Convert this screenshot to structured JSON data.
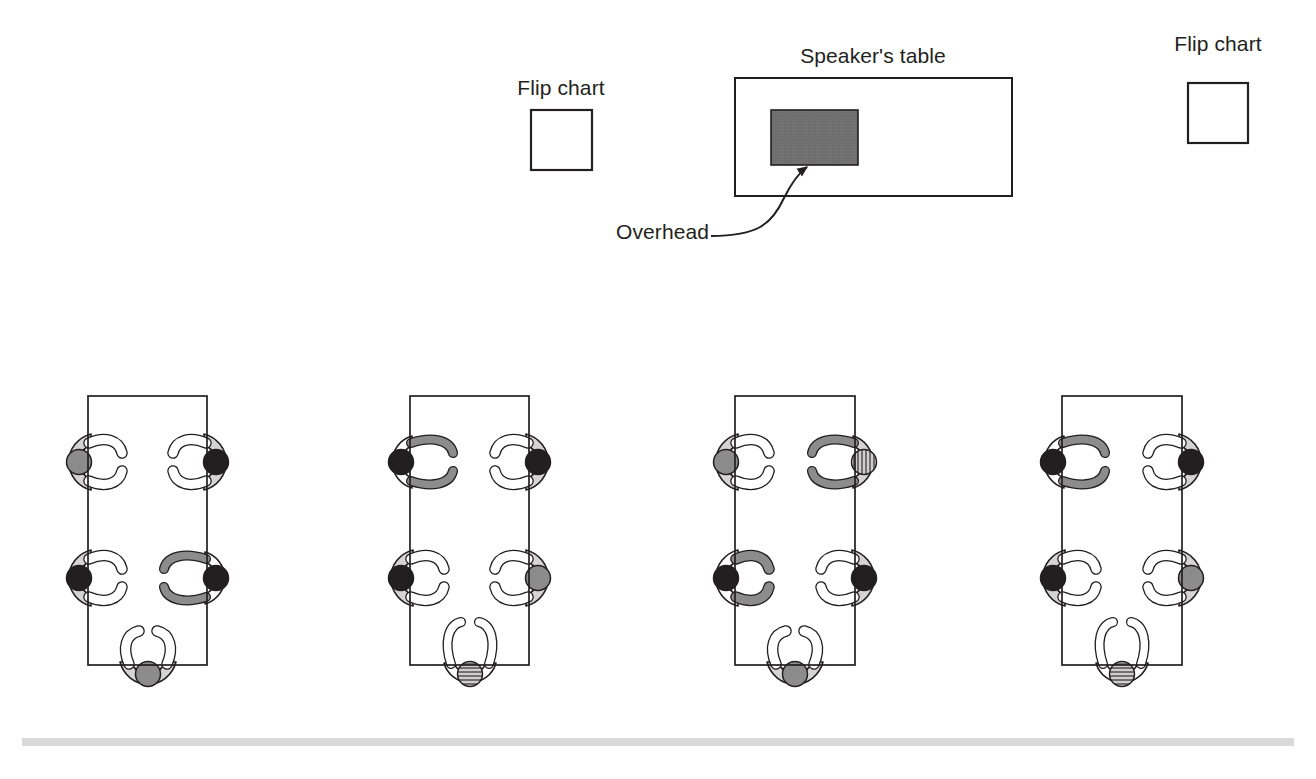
{
  "diagram": {
    "title_visible": false,
    "background_color": "#ffffff",
    "stroke_color": "#231f20",
    "room": {
      "front": {
        "flip_chart_left": {
          "label": "Flip chart",
          "label_x": 561,
          "label_y": 88,
          "x": 531,
          "y": 110,
          "w": 61,
          "h": 60,
          "fill": "#ffffff"
        },
        "flip_chart_right": {
          "label": "Flip chart",
          "label_x": 1218,
          "label_y": 61,
          "x": 1188,
          "y": 83,
          "w": 60,
          "h": 60,
          "fill": "#ffffff"
        },
        "speakers_table": {
          "label": "Speaker's table",
          "label_x": 873,
          "label_y": 56,
          "x": 735,
          "y": 78,
          "w": 277,
          "h": 118,
          "fill": "#ffffff"
        },
        "overhead": {
          "label": "Overhead",
          "label_x": 616,
          "label_y": 235,
          "x": 771,
          "y": 110,
          "w": 87,
          "h": 55,
          "fill": "#6e6e6e"
        }
      },
      "footer_rule": {
        "x": 22,
        "y": 738,
        "w": 1272,
        "h": 8,
        "color": "#d9d9d9"
      }
    },
    "palette": {
      "head_gray": "#8c8c8c",
      "head_black": "#231f20",
      "head_hatched": "#b3b3b3",
      "body_light": "#d4d4d4",
      "body_white": "#ffffff",
      "arm_white": "#ffffff",
      "arm_gray": "#8c8c8c",
      "outline": "#231f20",
      "overhead_gray": "#6e6e6e"
    },
    "tables": [
      {
        "name": "table-1",
        "x": 88,
        "y": 396,
        "w": 119,
        "h": 269,
        "seats": [
          {
            "position": "left-top",
            "cx": 88,
            "cy": 462,
            "facing": "right",
            "head": "gray",
            "body": "light",
            "arms": "white",
            "pose": "open"
          },
          {
            "position": "right-top",
            "cx": 207,
            "cy": 462,
            "facing": "left",
            "head": "black",
            "body": "light",
            "arms": "white",
            "pose": "open"
          },
          {
            "position": "left-bottom",
            "cx": 88,
            "cy": 578,
            "facing": "right",
            "head": "black",
            "body": "light",
            "arms": "white",
            "pose": "open"
          },
          {
            "position": "right-bottom",
            "cx": 207,
            "cy": 578,
            "facing": "left",
            "head": "black",
            "body": "white",
            "arms": "gray",
            "pose": "wide"
          },
          {
            "position": "bottom-head",
            "cx": 148,
            "cy": 665,
            "facing": "up",
            "head": "gray",
            "body": "light",
            "arms": "white",
            "pose": "open"
          }
        ]
      },
      {
        "name": "table-2",
        "x": 410,
        "y": 396,
        "w": 119,
        "h": 269,
        "seats": [
          {
            "position": "left-top",
            "cx": 410,
            "cy": 462,
            "facing": "right",
            "head": "black",
            "body": "white",
            "arms": "gray",
            "pose": "wide"
          },
          {
            "position": "right-top",
            "cx": 529,
            "cy": 462,
            "facing": "left",
            "head": "black",
            "body": "light",
            "arms": "white",
            "pose": "open"
          },
          {
            "position": "left-bottom",
            "cx": 410,
            "cy": 578,
            "facing": "right",
            "head": "black",
            "body": "light",
            "arms": "white",
            "pose": "open"
          },
          {
            "position": "right-bottom",
            "cx": 529,
            "cy": 578,
            "facing": "left",
            "head": "gray",
            "body": "light",
            "arms": "white",
            "pose": "open"
          },
          {
            "position": "bottom-head",
            "cx": 470,
            "cy": 665,
            "facing": "up",
            "head": "hatched",
            "body": "white",
            "arms": "white",
            "pose": "wide"
          }
        ]
      },
      {
        "name": "table-3",
        "x": 735,
        "y": 396,
        "w": 120,
        "h": 269,
        "seats": [
          {
            "position": "left-top",
            "cx": 735,
            "cy": 462,
            "facing": "right",
            "head": "gray",
            "body": "light",
            "arms": "white",
            "pose": "open"
          },
          {
            "position": "right-top",
            "cx": 855,
            "cy": 462,
            "facing": "left",
            "head": "hatched",
            "body": "light",
            "arms": "gray",
            "pose": "wide"
          },
          {
            "position": "left-bottom",
            "cx": 735,
            "cy": 578,
            "facing": "right",
            "head": "black",
            "body": "white",
            "arms": "gray",
            "pose": "open"
          },
          {
            "position": "right-bottom",
            "cx": 855,
            "cy": 578,
            "facing": "left",
            "head": "black",
            "body": "light",
            "arms": "white",
            "pose": "open"
          },
          {
            "position": "bottom-head",
            "cx": 795,
            "cy": 665,
            "facing": "up",
            "head": "gray",
            "body": "light",
            "arms": "white",
            "pose": "open"
          }
        ]
      },
      {
        "name": "table-4",
        "x": 1062,
        "y": 396,
        "w": 120,
        "h": 269,
        "seats": [
          {
            "position": "left-top",
            "cx": 1062,
            "cy": 462,
            "facing": "right",
            "head": "black",
            "body": "white",
            "arms": "gray",
            "pose": "wide"
          },
          {
            "position": "right-top",
            "cx": 1182,
            "cy": 462,
            "facing": "left",
            "head": "black",
            "body": "light",
            "arms": "white",
            "pose": "open"
          },
          {
            "position": "left-bottom",
            "cx": 1062,
            "cy": 578,
            "facing": "right",
            "head": "black",
            "body": "light",
            "arms": "white",
            "pose": "open"
          },
          {
            "position": "right-bottom",
            "cx": 1182,
            "cy": 578,
            "facing": "left",
            "head": "gray",
            "body": "light",
            "arms": "white",
            "pose": "open"
          },
          {
            "position": "bottom-head",
            "cx": 1122,
            "cy": 665,
            "facing": "up",
            "head": "hatched",
            "body": "white",
            "arms": "white",
            "pose": "wide"
          }
        ]
      }
    ]
  }
}
